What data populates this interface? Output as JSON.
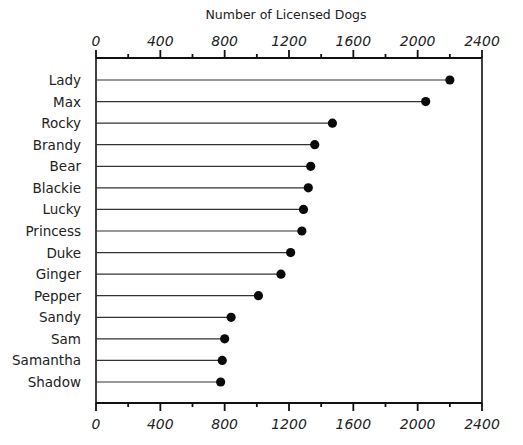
{
  "chart_data": {
    "type": "lollipop-bar",
    "orientation": "horizontal",
    "title": "Number of Licensed Dogs",
    "xlabel": "Number of Licensed Dogs",
    "ylabel": "",
    "xlim": [
      0,
      2400
    ],
    "x_ticks": [
      0,
      400,
      800,
      1200,
      1600,
      2000,
      2400
    ],
    "x_tick_labels": [
      "0",
      "400",
      "800",
      "1200",
      "1600",
      "2000",
      "2400"
    ],
    "x_minor_step": 200,
    "axes": [
      "top",
      "bottom"
    ],
    "grid": false,
    "legend": "none",
    "categories": [
      "Lady",
      "Max",
      "Rocky",
      "Brandy",
      "Bear",
      "Blackie",
      "Lucky",
      "Princess",
      "Duke",
      "Ginger",
      "Pepper",
      "Sandy",
      "Sam",
      "Samantha",
      "Shadow"
    ],
    "values": [
      2200,
      2050,
      1470,
      1360,
      1335,
      1320,
      1290,
      1280,
      1210,
      1150,
      1010,
      840,
      800,
      785,
      775
    ]
  }
}
